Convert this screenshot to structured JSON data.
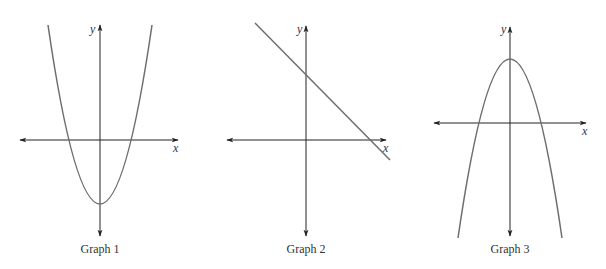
{
  "graphs": [
    {
      "caption": "Graph 1",
      "x_label": "x",
      "y_label": "y",
      "shape": "upward parabola",
      "stroke": "#6e6e6e"
    },
    {
      "caption": "Graph 2",
      "x_label": "x",
      "y_label": "y",
      "shape": "line with negative slope",
      "stroke": "#6e6e6e"
    },
    {
      "caption": "Graph 3",
      "x_label": "x",
      "y_label": "y",
      "shape": "downward parabola",
      "stroke": "#6e6e6e"
    }
  ],
  "axis_color": "#222222"
}
